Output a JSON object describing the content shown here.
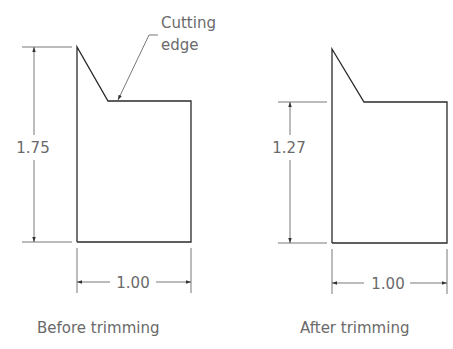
{
  "figures": [
    {
      "id": "before",
      "caption": "Before trimming",
      "height_label": "1.75",
      "width_label": "1.00",
      "annotation": {
        "line1": "Cutting",
        "line2": "edge"
      }
    },
    {
      "id": "after",
      "caption": "After trimming",
      "height_label": "1.27",
      "width_label": "1.00"
    }
  ],
  "colors": {
    "outline": "#2a2a2a",
    "dimension": "#555555",
    "text": "#6a6a6a",
    "background": "#ffffff"
  }
}
